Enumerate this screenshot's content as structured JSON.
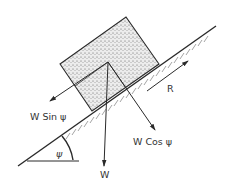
{
  "diagram": {
    "type": "free-body diagram — block on inclined plane",
    "colors": {
      "ink": "#2a2a2a",
      "block_fill": "#d9d9d9",
      "background": "#ffffff"
    },
    "labels": {
      "weight": "W",
      "parallel_component": "W Sin ψ",
      "normal_component": "W Cos ψ",
      "resistance": "R",
      "angle": "ψ"
    },
    "elements": [
      {
        "id": "incline",
        "description": "inclined plane surface with hatching below"
      },
      {
        "id": "block",
        "description": "stippled rectangular block resting on incline"
      },
      {
        "id": "weight-arrow",
        "label": "W",
        "direction": "vertical down"
      },
      {
        "id": "parallel-arrow",
        "label": "W Sin ψ",
        "direction": "down the slope"
      },
      {
        "id": "normal-arrow",
        "label": "W Cos ψ",
        "direction": "perpendicular into slope"
      },
      {
        "id": "resistance-arrow",
        "label": "R",
        "direction": "up the slope"
      },
      {
        "id": "angle-marker",
        "label": "ψ",
        "description": "angle between incline and horizontal"
      }
    ]
  }
}
